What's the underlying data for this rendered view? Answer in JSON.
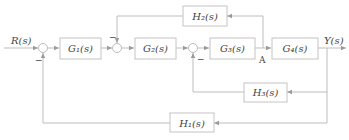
{
  "diagram": {
    "type": "control-system-block-diagram",
    "input": "R(s)",
    "output": "Y(s)",
    "blocks": [
      {
        "id": "G1",
        "label": "G₁(s)"
      },
      {
        "id": "G2",
        "label": "G₂(s)"
      },
      {
        "id": "G3",
        "label": "G₃(s)"
      },
      {
        "id": "G4",
        "label": "G₄(s)"
      },
      {
        "id": "H1",
        "label": "H₁(s)"
      },
      {
        "id": "H2",
        "label": "H₂(s)"
      },
      {
        "id": "H3",
        "label": "H₃(s)"
      }
    ],
    "summing_junctions": [
      {
        "id": "S1",
        "feedback_sign": "−"
      },
      {
        "id": "S2",
        "feedback_sign": "−"
      },
      {
        "id": "S3",
        "feedback_sign": "−"
      }
    ],
    "node_label": "A",
    "connections": [
      "R(s) -> S1",
      "S1 -> G1",
      "G1 -> S2",
      "S2 -> G2",
      "G2 -> S3",
      "S3 -> G3",
      "G3 -> A",
      "A -> G4",
      "G4 -> Y(s)",
      "A -> H2 -> S2 (-)",
      "Y(s) -> H3 -> S3 (-)",
      "Y(s) -> H1 -> S1 (-)"
    ]
  }
}
